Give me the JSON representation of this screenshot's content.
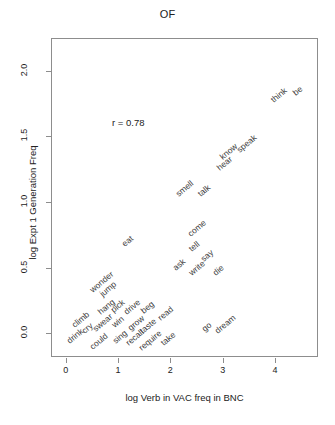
{
  "chart_data": {
    "type": "scatter",
    "title": "OF",
    "xlabel": "log Verb in VAC freq in BNC",
    "ylabel": "log Expt 1 Generation Freq",
    "annotation": "r = 0.78",
    "correlation": 0.78,
    "xlim": [
      -0.28,
      4.82
    ],
    "ylim": [
      -0.18,
      2.25
    ],
    "xticks": [
      0,
      1,
      2,
      3,
      4
    ],
    "xtick_labels": [
      "0",
      "1",
      "2",
      "3",
      "4"
    ],
    "yticks": [
      0.0,
      0.5,
      1.0,
      1.5,
      2.0
    ],
    "ytick_labels": [
      "0.0",
      "0.5",
      "1.0",
      "1.5",
      "2.0"
    ],
    "grid": false,
    "legend": false,
    "marker": "text-label",
    "label_rotation_deg": -40,
    "points": [
      {
        "label": "drink",
        "x": 0.02,
        "y": -0.06
      },
      {
        "label": "climb",
        "x": 0.12,
        "y": 0.06
      },
      {
        "label": "cry",
        "x": 0.32,
        "y": 0.02
      },
      {
        "label": "could",
        "x": 0.47,
        "y": -0.1
      },
      {
        "label": "swear",
        "x": 0.52,
        "y": 0.03
      },
      {
        "label": "hang",
        "x": 0.62,
        "y": 0.16
      },
      {
        "label": "wonder",
        "x": 0.47,
        "y": 0.33
      },
      {
        "label": "jump",
        "x": 0.66,
        "y": 0.3
      },
      {
        "label": "pick",
        "x": 0.86,
        "y": 0.18
      },
      {
        "label": "win",
        "x": 0.88,
        "y": 0.06
      },
      {
        "label": "sing",
        "x": 0.9,
        "y": -0.06
      },
      {
        "label": "eat",
        "x": 1.08,
        "y": 0.68
      },
      {
        "label": "drive",
        "x": 1.12,
        "y": 0.16
      },
      {
        "label": "grow",
        "x": 1.2,
        "y": 0.04
      },
      {
        "label": "recall",
        "x": 1.15,
        "y": -0.07
      },
      {
        "label": "beg",
        "x": 1.44,
        "y": 0.17
      },
      {
        "label": "taste",
        "x": 1.42,
        "y": 0.02
      },
      {
        "label": "require",
        "x": 1.4,
        "y": -0.11
      },
      {
        "label": "read",
        "x": 1.76,
        "y": 0.12
      },
      {
        "label": "take",
        "x": 1.82,
        "y": -0.07
      },
      {
        "label": "ask",
        "x": 2.05,
        "y": 0.5
      },
      {
        "label": "smell",
        "x": 2.1,
        "y": 1.06
      },
      {
        "label": "come",
        "x": 2.34,
        "y": 0.76
      },
      {
        "label": "tell",
        "x": 2.36,
        "y": 0.64
      },
      {
        "label": "write",
        "x": 2.35,
        "y": 0.46
      },
      {
        "label": "go",
        "x": 2.6,
        "y": 0.03
      },
      {
        "label": "say",
        "x": 2.58,
        "y": 0.57
      },
      {
        "label": "talk",
        "x": 2.52,
        "y": 1.06
      },
      {
        "label": "die",
        "x": 2.82,
        "y": 0.46
      },
      {
        "label": "dream",
        "x": 2.86,
        "y": 0.02
      },
      {
        "label": "hear",
        "x": 2.9,
        "y": 1.26
      },
      {
        "label": "know",
        "x": 2.94,
        "y": 1.34
      },
      {
        "label": "speak",
        "x": 3.28,
        "y": 1.4
      },
      {
        "label": "think",
        "x": 3.92,
        "y": 1.78
      },
      {
        "label": "be",
        "x": 4.34,
        "y": 1.83
      }
    ]
  },
  "style": {
    "frame_color": "#8d8d8d",
    "text_color": "#222222",
    "label_color": "#3a3a3a",
    "background": "#ffffff"
  }
}
